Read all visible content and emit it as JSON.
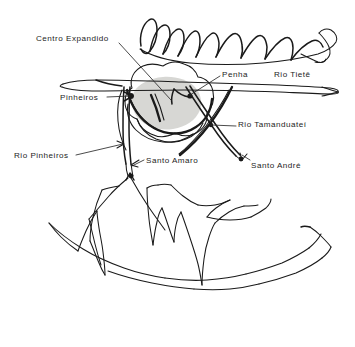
{
  "figure": {
    "kind": "hand-drawn-sketch-map",
    "region": "São Paulo",
    "background_color": "#ffffff",
    "ink_color": "#1a1a1a",
    "highlight_fill_color": "#d7d7d4"
  },
  "labels": {
    "centro_expandido": "Centro Expandido",
    "pinheiros": "Pinheiros",
    "rio_pinheiros": "Rio Pinheiros",
    "penha": "Penha",
    "rio_tiete": "Rio Tietê",
    "rio_tamanduatei": "Rio Tamanduateí",
    "santo_amaro": "Santo Amaro",
    "santo_andre": "Santo André"
  }
}
